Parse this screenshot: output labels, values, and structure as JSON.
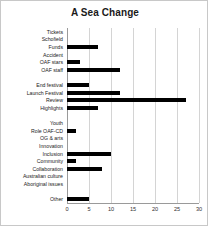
{
  "chart_data": {
    "type": "bar",
    "orientation": "horizontal",
    "title": "A Sea Change",
    "xlabel": "",
    "ylabel": "",
    "xlim": [
      0,
      30
    ],
    "xticks": [
      0,
      5,
      10,
      15,
      20,
      25,
      30
    ],
    "grid": true,
    "legend": false,
    "bar_color": "#000000",
    "categories": [
      "Tickets",
      "Schofield",
      "Funds",
      "Accident",
      "OAF stars",
      "OAF staff",
      "",
      "End festival",
      "Launch Festival",
      "Review",
      "Highlights",
      "",
      "Youth",
      "Role OAF-CD",
      "OG & arts",
      "Innovation",
      "Inclusion",
      "Community",
      "Collaboration",
      "Australian culture",
      "Aboriginal issues",
      "",
      "Other"
    ],
    "values": [
      0,
      0,
      7,
      0,
      3,
      12,
      0,
      5,
      12,
      27,
      7,
      0,
      0,
      2,
      0,
      0,
      10,
      2,
      8,
      0,
      0,
      0,
      5
    ]
  }
}
